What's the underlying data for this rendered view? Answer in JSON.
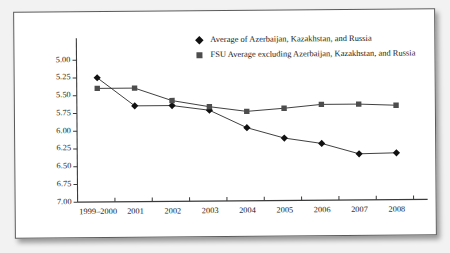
{
  "chart_data": {
    "type": "line",
    "title": "",
    "xlabel": "",
    "ylabel": "",
    "categories": [
      "1999–2000",
      "2001",
      "2002",
      "2003",
      "2004",
      "2005",
      "2006",
      "2007",
      "2008"
    ],
    "ylim": [
      5.0,
      7.0
    ],
    "y_inverted": true,
    "yticks": [
      "5.00",
      "5.25",
      "5.50",
      "5.75",
      "6.00",
      "6.25",
      "6.50",
      "6.75",
      "7.00"
    ],
    "grid": false,
    "legend_position": "top-center",
    "series": [
      {
        "name": "Average of Azerbaijan, Kazakhstan, and Russia",
        "marker": "diamond",
        "color": "#111111",
        "values": [
          5.25,
          5.65,
          5.65,
          5.72,
          5.97,
          6.12,
          6.2,
          6.35,
          6.34
        ]
      },
      {
        "name": "FSU Average excluding Azerbaijan, Kazakhstan, and Russia",
        "marker": "square",
        "color": "#4d4d4d",
        "values": [
          5.4,
          5.4,
          5.58,
          5.67,
          5.74,
          5.7,
          5.65,
          5.65,
          5.67
        ]
      }
    ]
  },
  "legend": {
    "items": [
      {
        "marker": "diamond-marker-icon",
        "label": "Average of Azerbaijan, Kazakhstan, and Russia"
      },
      {
        "marker": "square-marker-icon",
        "label": "FSU Average excluding Azerbaijan, Kazakhstan, and Russia"
      }
    ]
  },
  "colors": {
    "series_1": "#111111",
    "series_2": "#4d4d4d",
    "axis": "#3a3a3a",
    "card_background": "#ffffff",
    "page_background": "#f2f2f2"
  }
}
